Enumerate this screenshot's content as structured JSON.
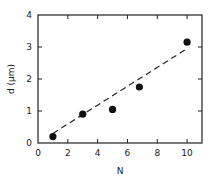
{
  "chart_data": {
    "type": "scatter",
    "title": "",
    "xlabel": "N",
    "ylabel": "d (μm)",
    "xlim": [
      0,
      11
    ],
    "ylim": [
      0,
      4
    ],
    "xticks": [
      0,
      2,
      4,
      6,
      8,
      10
    ],
    "yticks": [
      0,
      1,
      2,
      3,
      4
    ],
    "grid": false,
    "legend": null,
    "series": [
      {
        "name": "measured",
        "marker": "filled-circle",
        "x": [
          1,
          3,
          5,
          6.8,
          10
        ],
        "y": [
          0.2,
          0.9,
          1.05,
          1.75,
          3.15
        ]
      },
      {
        "name": "linear fit",
        "style": "dashed-line",
        "x": [
          1,
          10
        ],
        "y": [
          0.3,
          2.95
        ]
      }
    ]
  }
}
